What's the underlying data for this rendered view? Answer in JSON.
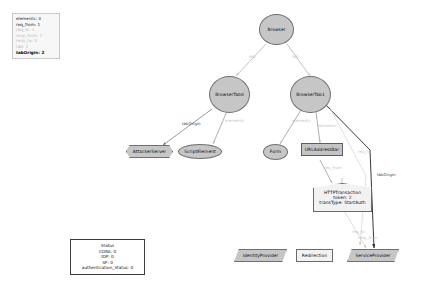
{
  "legend": {
    "name": "instance-info-panel",
    "lines": [
      {
        "text": "elements: 3",
        "style": "normal"
      },
      {
        "text": "req_from: 1",
        "style": "normal"
      },
      {
        "text": "req_to: 1",
        "style": "dim"
      },
      {
        "text": "resp_from: 1",
        "style": "dim"
      },
      {
        "text": "resp_to: 0",
        "style": "dim"
      },
      {
        "text": "tab: 2",
        "style": "dim"
      },
      {
        "text": "tabOrigin: 2",
        "style": "bold"
      }
    ]
  },
  "nodes": {
    "browser": "Browser",
    "browser_tab0": "BrowserTab0",
    "browser_tab1": "BrowserTab1",
    "attacker_server": "AttackerServer",
    "script_element": "ScriptElement",
    "form": "Form",
    "url_address_bar": "URLAddressBar",
    "http_transaction": {
      "title": "HTTPTransaction",
      "token": "token: 2",
      "trans_type": "transType: StartAuth"
    },
    "identity_provider": "IdentityProvider",
    "redirection": "Redirection",
    "service_provider": "ServiceProvider"
  },
  "status_box": {
    "title": "Status",
    "lines": [
      "CORA: 0",
      "IDP: 0",
      "SP: 0",
      "authentication_Status: 0"
    ]
  },
  "edge_labels": {
    "tab_left": "tab",
    "tab_right": "tab",
    "tab_origin_left": "tabOrigin",
    "elements_tab0": "elements",
    "elements_tab1_form": "elements",
    "elements_tab1_url": "elements",
    "req_to_upper": "req_to",
    "req_from": "req_from",
    "tab_origin_right": "tabOrigin",
    "req_to_lower": "req_to",
    "resp_from": "resp_from"
  },
  "colors": {
    "node_fill": "#c6c6c6",
    "node_stroke": "#6f6f6f",
    "edge": "#7a7a7a",
    "edge_faint": "#c9c9c9",
    "background": "#ffffff"
  }
}
